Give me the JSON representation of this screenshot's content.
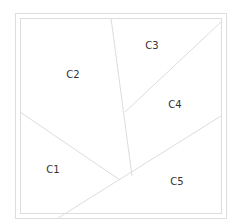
{
  "diagram": {
    "type": "partition",
    "frame": {
      "outer": {
        "x1": 15,
        "y1": 13,
        "x2": 226,
        "y2": 218
      },
      "inner": {
        "x1": 20,
        "y1": 18,
        "x2": 221,
        "y2": 213
      },
      "stroke": "#dddddd"
    },
    "dividers": [
      {
        "id": "c2-c3-c4",
        "x1": 111,
        "y1": 18,
        "x2": 132,
        "y2": 176
      },
      {
        "id": "c3-c4",
        "x1": 221,
        "y1": 22,
        "x2": 125,
        "y2": 112
      },
      {
        "id": "c4-c5",
        "x1": 221,
        "y1": 116,
        "x2": 58,
        "y2": 218
      },
      {
        "id": "c1-c2",
        "x1": 20,
        "y1": 112,
        "x2": 120,
        "y2": 180
      }
    ],
    "line_color": "#dddddd",
    "text_color": "#333333",
    "regions": [
      {
        "label": "C1",
        "x": 53,
        "y": 170
      },
      {
        "label": "C2",
        "x": 73,
        "y": 75
      },
      {
        "label": "C3",
        "x": 152,
        "y": 46
      },
      {
        "label": "C4",
        "x": 175,
        "y": 105
      },
      {
        "label": "C5",
        "x": 177,
        "y": 182
      }
    ]
  }
}
